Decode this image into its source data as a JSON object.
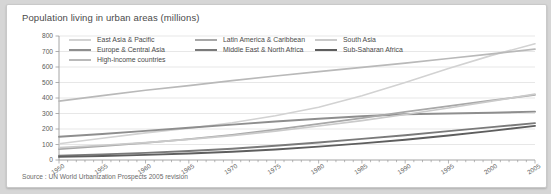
{
  "figure": {
    "title": "Population living in urban areas (millions)",
    "source_note": "Source : UN World Urbanization Prospects 2005 revision"
  },
  "chart_data": {
    "type": "line",
    "title": "Population living in urban areas (millions)",
    "xlabel": "",
    "ylabel": "",
    "xlim": [
      1950,
      2005
    ],
    "ylim": [
      0,
      800
    ],
    "ytick_step": 100,
    "grid": true,
    "legend_position": "top-inside",
    "x": [
      1950,
      1955,
      1960,
      1965,
      1970,
      1975,
      1980,
      1985,
      1990,
      1995,
      2000,
      2005
    ],
    "xtick_labels": [
      "1950",
      "1955",
      "1960",
      "1965",
      "1970",
      "1975",
      "1980",
      "1985",
      "1990",
      "1995",
      "2000",
      "2005"
    ],
    "ytick_labels": [
      "0",
      "100",
      "200",
      "300",
      "400",
      "500",
      "600",
      "700",
      "800"
    ],
    "series": [
      {
        "name": "East Asia & Pacific",
        "color": "#d2d2d2",
        "width": 1.6,
        "values": [
          105,
          140,
          175,
          205,
          240,
          285,
          340,
          415,
          500,
          590,
          675,
          750
        ]
      },
      {
        "name": "Europe & Central Asia",
        "color": "#8e8e8e",
        "width": 1.9,
        "values": [
          150,
          168,
          188,
          208,
          228,
          248,
          266,
          282,
          295,
          300,
          305,
          312
        ]
      },
      {
        "name": "High-income countries",
        "color": "#b9b9b9",
        "width": 1.7,
        "values": [
          380,
          415,
          450,
          480,
          512,
          542,
          570,
          598,
          625,
          655,
          685,
          715
        ]
      },
      {
        "name": "Latin America & Caribbean",
        "color": "#a8a8a8",
        "width": 1.7,
        "values": [
          70,
          90,
          110,
          135,
          163,
          196,
          233,
          270,
          310,
          348,
          385,
          420
        ]
      },
      {
        "name": "Middle East & North Africa",
        "color": "#7a7a7a",
        "width": 1.9,
        "values": [
          28,
          36,
          46,
          58,
          73,
          92,
          113,
          136,
          160,
          186,
          212,
          238
        ]
      },
      {
        "name": "South Asia",
        "color": "#cacaca",
        "width": 1.6,
        "values": [
          80,
          95,
          112,
          133,
          157,
          186,
          219,
          254,
          294,
          336,
          380,
          425
        ]
      },
      {
        "name": "Sub-Saharan Africa",
        "color": "#5e5e5e",
        "width": 1.9,
        "values": [
          20,
          26,
          33,
          42,
          53,
          68,
          86,
          107,
          131,
          158,
          188,
          220
        ]
      }
    ],
    "legend": [
      {
        "label": "East Asia & Pacific",
        "color": "#d2d2d2",
        "col": 0,
        "row": 0
      },
      {
        "label": "Latin America & Caribbean",
        "color": "#a8a8a8",
        "col": 1,
        "row": 0
      },
      {
        "label": "South Asia",
        "color": "#cacaca",
        "col": 2,
        "row": 0
      },
      {
        "label": "Europe & Central Asia",
        "color": "#8e8e8e",
        "col": 0,
        "row": 1
      },
      {
        "label": "Middle East & North Africa",
        "color": "#7a7a7a",
        "col": 1,
        "row": 1
      },
      {
        "label": "Sub-Saharan Africa",
        "color": "#5e5e5e",
        "col": 2,
        "row": 1
      },
      {
        "label": "High-income countries",
        "color": "#b9b9b9",
        "col": 0,
        "row": 2
      }
    ]
  }
}
